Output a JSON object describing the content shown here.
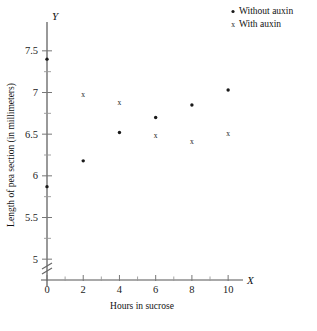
{
  "chart_data": {
    "type": "scatter",
    "title": "",
    "xlabel": "Hours in sucrose",
    "ylabel": "Length of pea section (in millimeters)",
    "x_axis_name": "X",
    "y_axis_name": "Y",
    "xlim": [
      0,
      10.6
    ],
    "ylim": [
      4.75,
      7.75
    ],
    "xticks": [
      0,
      2,
      4,
      6,
      8,
      10
    ],
    "xticklabels": [
      "0",
      "2",
      "4",
      "6",
      "8",
      "10"
    ],
    "xminorticks": [
      1,
      3,
      5,
      7,
      9
    ],
    "yticks": [
      5,
      5.5,
      6,
      6.5,
      7,
      7.5
    ],
    "yticklabels": [
      "5",
      "5.5",
      "6",
      "6.5",
      "7",
      "7.5"
    ],
    "yminorticks": [
      5.25,
      5.75,
      6.25,
      6.75,
      7.25
    ],
    "grid": false,
    "axis_break": true,
    "legend_position": "top-right",
    "series": [
      {
        "name": "Without auxin",
        "marker": "dot",
        "points": [
          {
            "x": 0,
            "y": 7.4
          },
          {
            "x": 0,
            "y": 5.87
          },
          {
            "x": 2,
            "y": 6.18
          },
          {
            "x": 4,
            "y": 6.52
          },
          {
            "x": 6,
            "y": 6.7
          },
          {
            "x": 8,
            "y": 6.85
          },
          {
            "x": 10,
            "y": 7.03
          }
        ]
      },
      {
        "name": "With auxin",
        "marker": "x",
        "points": [
          {
            "x": 2,
            "y": 6.98
          },
          {
            "x": 4,
            "y": 6.88
          },
          {
            "x": 6,
            "y": 6.49
          },
          {
            "x": 8,
            "y": 6.42
          },
          {
            "x": 10,
            "y": 6.51
          }
        ]
      }
    ]
  },
  "legend": {
    "items": [
      {
        "label": "Without auxin",
        "marker": "dot"
      },
      {
        "label": "With auxin",
        "marker": "x"
      }
    ]
  }
}
